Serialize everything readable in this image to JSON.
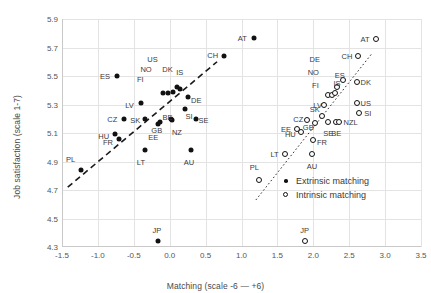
{
  "chart_data": {
    "type": "scatter",
    "title": "",
    "xlabel": "Matching (scale -6 — +6)",
    "ylabel": "Job satisfaction (scale 1-7)",
    "xlim": [
      -1.5,
      3.5
    ],
    "ylim": [
      4.3,
      5.9
    ],
    "xticks": [
      "-1.5",
      "-1.0",
      "-0.5",
      "0.0",
      "0.5",
      "1.0",
      "1.5",
      "2.0",
      "2.5",
      "3.0",
      "3.5"
    ],
    "xtick_values": [
      -1.5,
      -1.0,
      -0.5,
      0.0,
      0.5,
      1.0,
      1.5,
      2.0,
      2.5,
      3.0,
      3.5
    ],
    "yticks": [
      "4.3",
      "4.5",
      "4.7",
      "4.9",
      "5.1",
      "5.3",
      "5.5",
      "5.7",
      "5.9"
    ],
    "ytick_values": [
      4.3,
      4.5,
      4.7,
      4.9,
      5.1,
      5.3,
      5.5,
      5.7,
      5.9
    ],
    "grid": true,
    "legend_position": "bottom-right",
    "series": [
      {
        "name": "Extrinsic matching",
        "marker": "filled-circle",
        "color": "#111111",
        "points": [
          {
            "label": "PL",
            "x": -1.24,
            "y": 4.84,
            "lx": -1.38,
            "ly": 4.92
          },
          {
            "label": "LT",
            "x": -0.35,
            "y": 4.98,
            "lx": -0.4,
            "ly": 4.9
          },
          {
            "label": "AU",
            "x": 0.29,
            "y": 4.98,
            "lx": 0.27,
            "ly": 4.9
          },
          {
            "label": "JP",
            "x": -0.16,
            "y": 4.34,
            "lx": -0.18,
            "ly": 4.42
          },
          {
            "label": "FR",
            "x": -0.7,
            "y": 5.06,
            "lx": -0.86,
            "ly": 5.04
          },
          {
            "label": "HU",
            "x": -0.76,
            "y": 5.09,
            "lx": -0.92,
            "ly": 5.08
          },
          {
            "label": "CZ",
            "x": -0.63,
            "y": 5.2,
            "lx": -0.8,
            "ly": 5.2
          },
          {
            "label": "SK",
            "x": -0.34,
            "y": 5.2,
            "lx": -0.48,
            "ly": 5.19
          },
          {
            "label": "LV",
            "x": -0.4,
            "y": 5.31,
            "lx": -0.56,
            "ly": 5.3
          },
          {
            "label": "ES",
            "x": -0.74,
            "y": 5.5,
            "lx": -0.9,
            "ly": 5.5
          },
          {
            "label": "EE",
            "x": -0.16,
            "y": 5.16,
            "lx": -0.23,
            "ly": 5.07
          },
          {
            "label": "GB",
            "x": -0.14,
            "y": 5.18,
            "lx": -0.18,
            "ly": 5.12
          },
          {
            "label": "NZ",
            "x": 0.03,
            "y": 5.19,
            "lx": 0.1,
            "ly": 5.11
          },
          {
            "label": "BE",
            "x": 0.02,
            "y": 5.2,
            "lx": -0.03,
            "ly": 5.21
          },
          {
            "label": "FI",
            "x": -0.09,
            "y": 5.38,
            "lx": -0.41,
            "ly": 5.48
          },
          {
            "label": "NO",
            "x": -0.03,
            "y": 5.38,
            "lx": -0.33,
            "ly": 5.55
          },
          {
            "label": "US",
            "x": 0.05,
            "y": 5.39,
            "lx": -0.24,
            "ly": 5.62
          },
          {
            "label": "DK",
            "x": 0.1,
            "y": 5.42,
            "lx": -0.03,
            "ly": 5.55
          },
          {
            "label": "IS",
            "x": 0.14,
            "y": 5.41,
            "lx": 0.14,
            "ly": 5.53
          },
          {
            "label": "SI",
            "x": 0.22,
            "y": 5.27,
            "lx": 0.27,
            "ly": 5.22
          },
          {
            "label": "DE",
            "x": 0.26,
            "y": 5.35,
            "lx": 0.37,
            "ly": 5.33
          },
          {
            "label": "SE",
            "x": 0.36,
            "y": 5.2,
            "lx": 0.47,
            "ly": 5.19
          },
          {
            "label": "CH",
            "x": 0.76,
            "y": 5.64,
            "lx": 0.6,
            "ly": 5.65
          },
          {
            "label": "AT",
            "x": 1.17,
            "y": 5.77,
            "lx": 1.01,
            "ly": 5.77
          }
        ]
      },
      {
        "name": "Intrinsic matching",
        "marker": "hollow-circle",
        "color": "#111111",
        "points": [
          {
            "label": "PL",
            "x": 1.25,
            "y": 4.77,
            "lx": 1.18,
            "ly": 4.86
          },
          {
            "label": "LT",
            "x": 1.61,
            "y": 4.95,
            "lx": 1.46,
            "ly": 4.95
          },
          {
            "label": "AU",
            "x": 1.98,
            "y": 4.95,
            "lx": 1.98,
            "ly": 4.87
          },
          {
            "label": "JP",
            "x": 1.88,
            "y": 4.34,
            "lx": 1.88,
            "ly": 4.42
          },
          {
            "label": "FR",
            "x": 2.0,
            "y": 5.05,
            "lx": 2.12,
            "ly": 5.04
          },
          {
            "label": "HU",
            "x": 1.83,
            "y": 5.11,
            "lx": 1.68,
            "ly": 5.09
          },
          {
            "label": "EE",
            "x": 1.77,
            "y": 5.13,
            "lx": 1.62,
            "ly": 5.13
          },
          {
            "label": "CZ",
            "x": 1.91,
            "y": 5.19,
            "lx": 1.79,
            "ly": 5.2
          },
          {
            "label": "GB",
            "x": 2.02,
            "y": 5.17,
            "lx": 1.93,
            "ly": 5.14
          },
          {
            "label": "SK",
            "x": 2.12,
            "y": 5.22,
            "lx": 2.02,
            "ly": 5.27
          },
          {
            "label": "SE",
            "x": 2.2,
            "y": 5.18,
            "lx": 2.21,
            "ly": 5.1
          },
          {
            "label": "BE",
            "x": 2.31,
            "y": 5.18,
            "lx": 2.32,
            "ly": 5.1
          },
          {
            "label": "NZL",
            "x": 2.36,
            "y": 5.18,
            "lx": 2.52,
            "ly": 5.18
          },
          {
            "label": "LV",
            "x": 2.15,
            "y": 5.3,
            "lx": 2.06,
            "ly": 5.3
          },
          {
            "label": "FI",
            "x": 2.21,
            "y": 5.37,
            "lx": 2.03,
            "ly": 5.44
          },
          {
            "label": "NO",
            "x": 2.26,
            "y": 5.37,
            "lx": 2.0,
            "ly": 5.53
          },
          {
            "label": "DE",
            "x": 2.3,
            "y": 5.38,
            "lx": 2.02,
            "ly": 5.62
          },
          {
            "label": "IS",
            "x": 2.33,
            "y": 5.42,
            "lx": 2.33,
            "ly": 5.45
          },
          {
            "label": "ES",
            "x": 2.41,
            "y": 5.47,
            "lx": 2.37,
            "ly": 5.51
          },
          {
            "label": "DK",
            "x": 2.61,
            "y": 5.46,
            "lx": 2.73,
            "ly": 5.46
          },
          {
            "label": "US",
            "x": 2.61,
            "y": 5.31,
            "lx": 2.73,
            "ly": 5.31
          },
          {
            "label": "SI",
            "x": 2.64,
            "y": 5.24,
            "lx": 2.76,
            "ly": 5.24
          },
          {
            "label": "CH",
            "x": 2.62,
            "y": 5.64,
            "lx": 2.47,
            "ly": 5.64
          },
          {
            "label": "AT",
            "x": 2.87,
            "y": 5.76,
            "lx": 2.72,
            "ly": 5.76
          }
        ]
      }
    ],
    "trendlines": [
      {
        "name": "extrinsic-trendline",
        "style": "dashed",
        "x1": -1.42,
        "y1": 4.72,
        "x2": 0.66,
        "y2": 5.6
      },
      {
        "name": "intrinsic-trendline",
        "style": "dotted",
        "x1": 1.2,
        "y1": 4.63,
        "x2": 2.82,
        "y2": 5.66
      }
    ]
  },
  "legend": {
    "items": [
      {
        "label": "Extrinsic matching",
        "marker": "filled-circle"
      },
      {
        "label": "Intrinsic matching",
        "marker": "hollow-circle"
      }
    ]
  }
}
